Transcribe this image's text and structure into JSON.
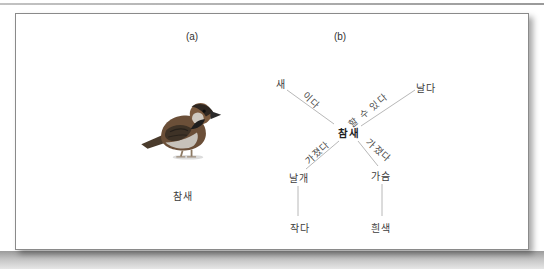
{
  "panel_a": {
    "label": "(a)",
    "caption": "참새",
    "image": "sparrow"
  },
  "panel_b": {
    "label": "(b)",
    "center": "참새",
    "nodes": {
      "bird": "새",
      "fly": "날다",
      "wing": "날개",
      "chest": "가슴",
      "small": "작다",
      "white": "흰색"
    },
    "edge_labels": {
      "isa": "이다",
      "can": "할 수 있다",
      "has_left": "가졌다",
      "has_right": "가졌다"
    }
  },
  "colors": {
    "frame_border": "#8a8a8a",
    "edge_line": "#b8b8b8",
    "text": "#3c3c3c"
  }
}
